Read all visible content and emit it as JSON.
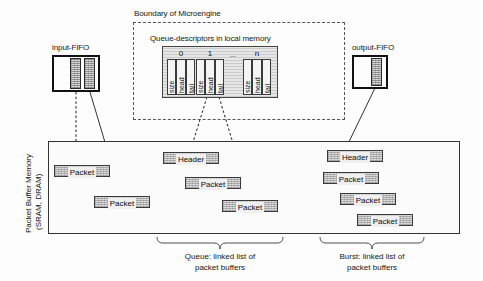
{
  "figure": {
    "boundary_label": "Boundary of Microengine",
    "descriptors_title": "Queue-descriptors in local memory",
    "memory_label_line1": "Packet Buffer Memory",
    "memory_label_line2": "(SRAM, DRAM)"
  },
  "fifos": {
    "input": {
      "label": "input-FIFO",
      "cells": [
        "",
        ""
      ]
    },
    "output": {
      "label": "output-FIFO",
      "cells": [
        ""
      ]
    }
  },
  "descriptors": {
    "columns": [
      {
        "index_label": "0",
        "fields": [
          "size",
          "head",
          "tail"
        ]
      },
      {
        "index_label": "1",
        "fields": [
          "size",
          "head",
          "tail"
        ]
      },
      {
        "index_label": "",
        "fields": [],
        "ellipsis": "..."
      },
      {
        "index_label": "n",
        "fields": [
          "size",
          "head",
          "tail"
        ]
      }
    ],
    "field_size": "size",
    "field_head": "head",
    "field_tail": "tail"
  },
  "memory": {
    "free_buffers": [
      {
        "label": "Packet"
      },
      {
        "label": "Packet"
      }
    ],
    "queue_chain": [
      {
        "label": "Header"
      },
      {
        "label": "Packet"
      },
      {
        "label": "Packet"
      }
    ],
    "burst_chain": [
      {
        "label": "Header"
      },
      {
        "label": "Packet"
      },
      {
        "label": "Packet"
      },
      {
        "label": "Packet"
      }
    ]
  },
  "captions": {
    "queue_line1": "Queue: linked list of",
    "queue_line2": "packet buffers",
    "burst_line1": "Burst: linked list of",
    "burst_line2": "packet buffers"
  },
  "colors": {
    "line": "#2a2a2a",
    "dashed": "#555555",
    "hatch_fill": "#d8d8d8",
    "background": "#ffffff"
  }
}
